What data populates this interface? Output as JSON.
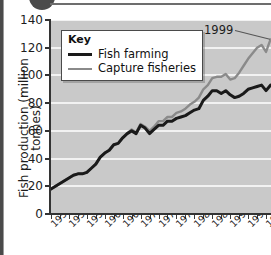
{
  "chart_data": {
    "type": "line",
    "title": "",
    "xlabel": "",
    "ylabel": "Fish production (million tonnes)",
    "ylim": [
      0,
      140
    ],
    "xlim": [
      1950,
      1999
    ],
    "grid": true,
    "legend_position": "top-left",
    "y_ticks": [
      0,
      20,
      40,
      60,
      80,
      100,
      120,
      140
    ],
    "x_tick_labels": [
      "1950",
      "1954",
      "1958",
      "1962",
      "1966",
      "1970",
      "1974",
      "1978",
      "1982",
      "1986",
      "1990",
      "1994",
      "199"
    ],
    "x_tick_years": [
      1950,
      1954,
      1958,
      1962,
      1966,
      1970,
      1974,
      1978,
      1982,
      1986,
      1990,
      1994,
      1998
    ],
    "annotations": [
      {
        "text": "1999",
        "target_year": 1999
      }
    ],
    "x": [
      1950,
      1951,
      1952,
      1953,
      1954,
      1955,
      1956,
      1957,
      1958,
      1959,
      1960,
      1961,
      1962,
      1963,
      1964,
      1965,
      1966,
      1967,
      1968,
      1969,
      1970,
      1971,
      1972,
      1973,
      1974,
      1975,
      1976,
      1977,
      1978,
      1979,
      1980,
      1981,
      1982,
      1983,
      1984,
      1985,
      1986,
      1987,
      1988,
      1989,
      1990,
      1991,
      1992,
      1993,
      1994,
      1995,
      1996,
      1997,
      1998,
      1999
    ],
    "series": [
      {
        "name": "Fish farming",
        "color": "#1a1a1a",
        "values": [
          18,
          20,
          22,
          24,
          26,
          28,
          29,
          29,
          30,
          33,
          36,
          41,
          44,
          46,
          50,
          51,
          55,
          58,
          60,
          58,
          64,
          62,
          58,
          61,
          64,
          64,
          67,
          67,
          69,
          70,
          71,
          73,
          75,
          76,
          82,
          85,
          89,
          89,
          87,
          89,
          86,
          84,
          85,
          87,
          90,
          91,
          92,
          93,
          89,
          93
        ]
      },
      {
        "name": "Capture fisheries",
        "color": "#8a8a8a",
        "values": [
          18,
          20,
          22,
          24,
          26,
          28,
          29,
          29,
          30,
          33,
          36,
          41,
          44,
          46,
          50,
          51,
          55,
          58,
          61,
          59,
          65,
          63,
          60,
          63,
          67,
          67,
          70,
          70,
          73,
          74,
          76,
          79,
          81,
          84,
          90,
          93,
          98,
          99,
          99,
          101,
          97,
          98,
          102,
          107,
          112,
          116,
          120,
          122,
          117,
          126
        ]
      }
    ]
  },
  "legend": {
    "title": "Key",
    "items": [
      {
        "label": "Fish farming",
        "color": "#1a1a1a"
      },
      {
        "label": "Capture fisheries",
        "color": "#8a8a8a"
      }
    ]
  }
}
